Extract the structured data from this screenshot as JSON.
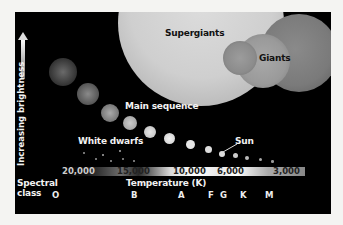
{
  "labels": {
    "supergiants": "Supergiants",
    "giants": "Giants",
    "main_sequence": "Main sequence",
    "white_dwarfs": "White dwarfs",
    "sun": "Sun",
    "y_axis": "Increasing brightness",
    "x_axis": "Temperature (K)",
    "spectral_class": "Spectral",
    "spectral_class_2": "class"
  },
  "temperature_ticks": [
    "20,000",
    "15,000",
    "10,000",
    "6,000",
    "3,000"
  ],
  "spectral_classes": [
    "O",
    "B",
    "A",
    "F",
    "G",
    "K",
    "M"
  ],
  "colors": {
    "background": "#000000",
    "page": "#f4f4f2",
    "text": "#f2f2f2"
  }
}
